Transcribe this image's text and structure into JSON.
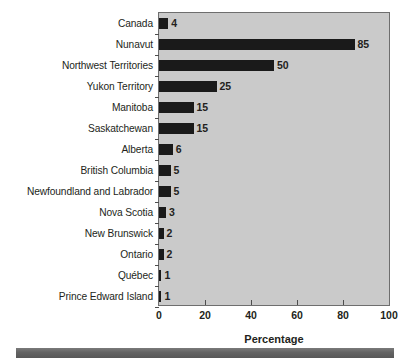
{
  "chart_data": {
    "type": "bar",
    "orientation": "horizontal",
    "title": "",
    "xlabel": "Percentage",
    "ylabel": "",
    "xlim": [
      0,
      100
    ],
    "xticks": [
      0,
      20,
      40,
      60,
      80,
      100
    ],
    "xtick_labels": [
      "0",
      "20",
      "40",
      "60",
      "80",
      "100"
    ],
    "grid": false,
    "legend": null,
    "bar_color": "#1a1a1a",
    "plot_background": "#cacaca",
    "categories": [
      "Canada",
      "Nunavut",
      "Northwest Territories",
      "Yukon Territory",
      "Manitoba",
      "Saskatchewan",
      "Alberta",
      "British Columbia",
      "Newfoundland and Labrador",
      "Nova Scotia",
      "New Brunswick",
      "Ontario",
      "Québec",
      "Prince Edward Island"
    ],
    "values": [
      4,
      85,
      50,
      25,
      15,
      15,
      6,
      5,
      5,
      3,
      2,
      2,
      1,
      1
    ],
    "data_labels": [
      "4",
      "85",
      "50",
      "25",
      "15",
      "15",
      "6",
      "5",
      "5",
      "3",
      "2",
      "2",
      "1",
      "1"
    ]
  },
  "footer": {
    "rule_color": "#6b6b6b"
  }
}
